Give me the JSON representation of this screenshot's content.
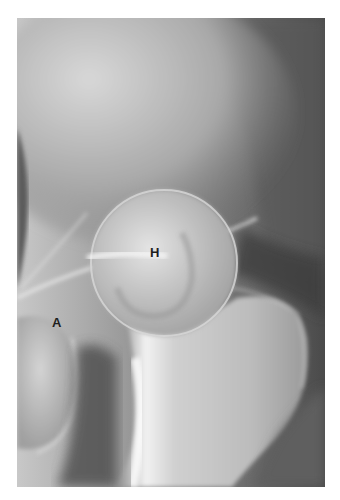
{
  "figure": {
    "type": "radiograph",
    "labels": [
      {
        "text": "H",
        "x": 150,
        "y": 246
      },
      {
        "text": "A",
        "x": 52,
        "y": 316
      }
    ],
    "colors": {
      "background": "#ffffff",
      "bone_light": "#e6e6e6",
      "soft_tissue": "#6a6a6a",
      "dark": "#3a3a3a",
      "label": "#1e1e1e"
    }
  }
}
